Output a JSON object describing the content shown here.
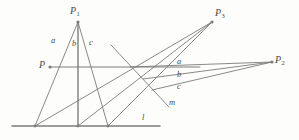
{
  "figure": {
    "type": "geometry-diagram",
    "background_color": "#fdfdfc",
    "stroke_color": "#7c7c7c",
    "label_color": "#4a4a4a",
    "width": 299,
    "height": 140
  },
  "points": [
    {
      "id": "P1",
      "base": "P",
      "sub": "1",
      "x": 78,
      "y": 22,
      "label_x": 70,
      "label_y": 6,
      "dot": true
    },
    {
      "id": "P3",
      "base": "P",
      "sub": "3",
      "x": 212,
      "y": 22,
      "label_x": 215,
      "label_y": 8,
      "dot": true
    },
    {
      "id": "P2",
      "base": "P",
      "sub": "2",
      "x": 272,
      "y": 62,
      "label_x": 275,
      "label_y": 55,
      "dot": true
    },
    {
      "id": "P",
      "base": "P",
      "sub": "",
      "x": 50,
      "y": 67,
      "label_x": 39,
      "label_y": 60,
      "dot": true
    }
  ],
  "line_labels": [
    {
      "id": "a-left",
      "text": "a",
      "x": 51,
      "y": 36
    },
    {
      "id": "b-left",
      "text": "b",
      "x": 72,
      "y": 39
    },
    {
      "id": "c-left",
      "text": "c",
      "x": 89,
      "y": 38
    },
    {
      "id": "a-right",
      "text": "a",
      "x": 177,
      "y": 57
    },
    {
      "id": "b-right",
      "text": "b",
      "x": 177,
      "y": 70
    },
    {
      "id": "c-right",
      "text": "c",
      "x": 177,
      "y": 82
    },
    {
      "id": "m",
      "text": "m",
      "x": 169,
      "y": 98
    },
    {
      "id": "l",
      "text": "l",
      "x": 142,
      "y": 113
    }
  ],
  "segments": [
    {
      "id": "line-l",
      "x1": 12,
      "y1": 126,
      "x2": 160,
      "y2": 126,
      "width": 1.5
    },
    {
      "id": "line-m",
      "x1": 111,
      "y1": 45,
      "x2": 169,
      "y2": 107,
      "width": 0.9
    },
    {
      "id": "line-P-horizontal",
      "x1": 50,
      "y1": 67,
      "x2": 200,
      "y2": 67,
      "width": 1.0
    },
    {
      "id": "a-P1-to-l",
      "x1": 78,
      "y1": 22,
      "x2": 35,
      "y2": 126,
      "width": 0.9
    },
    {
      "id": "b-P1-to-l",
      "x1": 78,
      "y1": 22,
      "x2": 78,
      "y2": 126,
      "width": 1.4
    },
    {
      "id": "c-P1-to-l",
      "x1": 78,
      "y1": 22,
      "x2": 108,
      "y2": 126,
      "width": 0.9
    },
    {
      "id": "a-l-to-P3",
      "x1": 35,
      "y1": 126,
      "x2": 212,
      "y2": 22,
      "width": 0.9
    },
    {
      "id": "b-l-to-P3",
      "x1": 78,
      "y1": 126,
      "x2": 212,
      "y2": 22,
      "width": 0.9
    },
    {
      "id": "c-l-to-P3",
      "x1": 108,
      "y1": 126,
      "x2": 212,
      "y2": 22,
      "width": 0.9
    },
    {
      "id": "a-to-P2",
      "x1": 130,
      "y1": 67,
      "x2": 272,
      "y2": 62,
      "width": 0.9
    },
    {
      "id": "b-to-P2",
      "x1": 143,
      "y1": 79,
      "x2": 272,
      "y2": 62,
      "width": 0.9
    },
    {
      "id": "c-to-P2",
      "x1": 152,
      "y1": 90,
      "x2": 272,
      "y2": 62,
      "width": 0.9
    }
  ],
  "tick_points": [
    {
      "id": "tick-l-a",
      "x": 35,
      "y": 126
    },
    {
      "id": "tick-l-b",
      "x": 78,
      "y": 126
    },
    {
      "id": "tick-l-c",
      "x": 108,
      "y": 126
    }
  ]
}
